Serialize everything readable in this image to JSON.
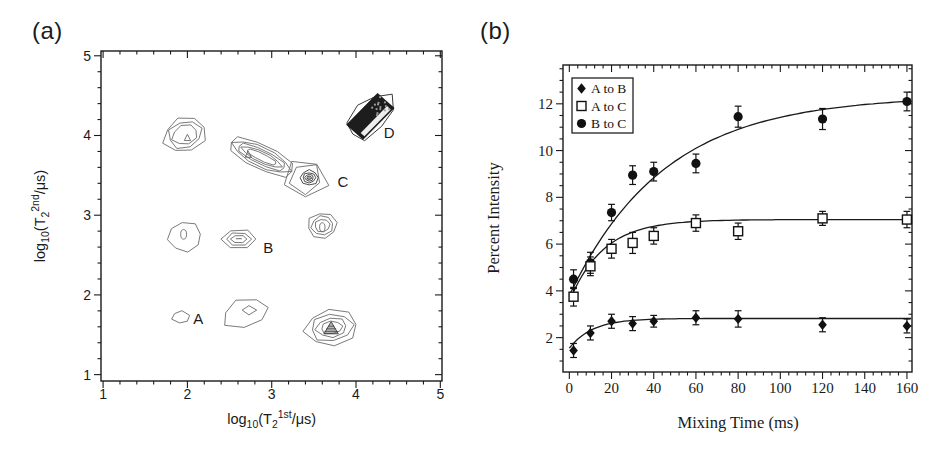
{
  "panels": {
    "a": {
      "tag": "(a)"
    },
    "b": {
      "tag": "(b)"
    }
  },
  "colors": {
    "axis": "#1a1a1a",
    "contour_line": "#6a6a6a",
    "contour_dark": "#3a3a3a",
    "marker_fill": "#111111",
    "curve": "#1a1a1a",
    "background": "#ffffff"
  },
  "chart_data": [
    {
      "type": "contour",
      "panel": "a",
      "xlabel_plain": "log10(T2 1st /us)",
      "ylabel_plain": "log10(T2 2nd /us)",
      "xlabel_parts": [
        {
          "t": "log",
          "k": "n"
        },
        {
          "t": "10",
          "k": "sub"
        },
        {
          "t": "(T",
          "k": "n"
        },
        {
          "t": "2",
          "k": "sub"
        },
        {
          "t": "1st",
          "k": "sup"
        },
        {
          "t": "/μs)",
          "k": "n"
        }
      ],
      "ylabel_parts": [
        {
          "t": "log",
          "k": "n"
        },
        {
          "t": "10",
          "k": "sub"
        },
        {
          "t": "(T",
          "k": "n"
        },
        {
          "t": "2",
          "k": "sub"
        },
        {
          "t": "2nd",
          "k": "sup"
        },
        {
          "t": "/μs)",
          "k": "n"
        }
      ],
      "box": {
        "left": 101,
        "top": 51,
        "right": 442,
        "bottom": 381
      },
      "x_range": [
        0.975,
        5.02
      ],
      "y_range": [
        0.92,
        5.06
      ],
      "x_ticks": [
        1,
        2,
        3,
        4,
        5
      ],
      "y_ticks": [
        1,
        2,
        3,
        4,
        5
      ],
      "x_minor_step": 0.2,
      "y_minor_step": 0.2,
      "peak_labels": [
        {
          "text": "A",
          "x": 2.07,
          "y": 1.7
        },
        {
          "text": "B",
          "x": 2.9,
          "y": 2.59
        },
        {
          "text": "C",
          "x": 3.78,
          "y": 3.42
        },
        {
          "text": "D",
          "x": 4.33,
          "y": 4.03
        }
      ],
      "peaks_summary": [
        {
          "label": "A",
          "x": 1.92,
          "y": 1.72
        },
        {
          "label": "B",
          "x": 2.61,
          "y": 2.7
        },
        {
          "label": "C",
          "x": 3.4,
          "y": 3.46
        },
        {
          "label": "D",
          "x": 4.17,
          "y": 4.24
        },
        {
          "label": "",
          "x": 1.97,
          "y": 4.01
        },
        {
          "label": "",
          "x": 1.97,
          "y": 2.73
        },
        {
          "label": "",
          "x": 2.69,
          "y": 1.77
        },
        {
          "label": "",
          "x": 2.88,
          "y": 3.73
        },
        {
          "label": "",
          "x": 3.6,
          "y": 2.87
        },
        {
          "label": "",
          "x": 3.71,
          "y": 1.59
        }
      ],
      "contours": [
        {
          "name": "peak-upper-left",
          "cx": 1.97,
          "cy": 4.01,
          "rot": 22,
          "sides": 8,
          "jit": 0.1,
          "seed": 1,
          "rings": [
            [
              0.26,
              0.21
            ],
            [
              0.205,
              0.165
            ],
            [
              0.155,
              0.12
            ]
          ],
          "inner": {
            "type": "ring",
            "cx": 2.0,
            "cy": 3.96,
            "rings": [
              [
                0.05,
                0.045
              ]
            ],
            "sides": 3,
            "rot": 90,
            "jit": 0.15,
            "seed": 2
          }
        },
        {
          "name": "peak-left-mid",
          "cx": 1.97,
          "cy": 2.73,
          "rot": 10,
          "sides": 8,
          "jit": 0.07,
          "seed": 3,
          "rings": [
            [
              0.2,
              0.185
            ]
          ],
          "inner": {
            "type": "ellipse",
            "cx": 1.955,
            "cy": 2.76,
            "rx": 0.035,
            "ry": 0.06
          }
        },
        {
          "name": "peak-A",
          "cx": 1.92,
          "cy": 1.72,
          "rot": 80,
          "sides": 6,
          "jit": 0.14,
          "seed": 4,
          "rings": [
            [
              0.075,
              0.105
            ]
          ]
        },
        {
          "name": "peak-B",
          "cx": 2.61,
          "cy": 2.7,
          "rot": 0,
          "sides": 6,
          "jit": 0.05,
          "seed": 5,
          "rings": [
            [
              0.205,
              0.125
            ],
            [
              0.15,
              0.085
            ],
            [
              0.095,
              0.05
            ]
          ],
          "inner": {
            "type": "dash",
            "x1": 2.575,
            "y1": 2.705,
            "x2": 2.645,
            "y2": 2.705
          }
        },
        {
          "name": "peak-below-B",
          "cx": 2.69,
          "cy": 1.77,
          "rot": 15,
          "sides": 7,
          "jit": 0.12,
          "seed": 6,
          "rings": [
            [
              0.285,
              0.175
            ]
          ],
          "inner": {
            "type": "ring",
            "cx": 2.73,
            "cy": 1.81,
            "rings": [
              [
                0.085,
                0.055
              ]
            ],
            "sides": 4,
            "rot": 0,
            "jit": 0.12,
            "seed": 7
          }
        },
        {
          "name": "peak-C-ridge",
          "cx": 2.88,
          "cy": 3.73,
          "rot": -27,
          "sides": 10,
          "jit": 0.07,
          "seed": 8,
          "rings": [
            [
              0.43,
              0.155
            ],
            [
              0.375,
              0.12
            ],
            [
              0.32,
              0.092
            ],
            [
              0.26,
              0.066
            ],
            [
              0.2,
              0.044
            ]
          ],
          "inner": {
            "type": "ring",
            "cx": 2.72,
            "cy": 3.75,
            "rings": [
              [
                0.05,
                0.045
              ]
            ],
            "sides": 3,
            "rot": 90,
            "jit": 0.12,
            "seed": 9
          }
        },
        {
          "name": "peak-C-core",
          "cx": 3.4,
          "cy": 3.46,
          "rot": -90,
          "sides": 5,
          "jit": 0.13,
          "seed": 10,
          "rings": [
            [
              0.25,
              0.26
            ],
            [
              0.19,
              0.2
            ]
          ],
          "inner": {
            "type": "rings-dark",
            "cx": 3.445,
            "cy": 3.47,
            "rings": [
              [
                0.105,
                0.095
              ],
              [
                0.075,
                0.065
              ],
              [
                0.05,
                0.042
              ],
              [
                0.028,
                0.022
              ]
            ],
            "sides": 8,
            "rot": 0,
            "jit": 0.08,
            "seed": 11
          }
        },
        {
          "name": "peak-right-mid",
          "cx": 3.6,
          "cy": 2.87,
          "rot": 12,
          "sides": 8,
          "jit": 0.08,
          "seed": 12,
          "rings": [
            [
              0.175,
              0.16
            ],
            [
              0.13,
              0.12
            ],
            [
              0.09,
              0.08
            ]
          ],
          "inner": {
            "type": "ellipse",
            "cx": 3.6,
            "cy": 2.85,
            "rx": 0.032,
            "ry": 0.055
          }
        },
        {
          "name": "peak-lower-right",
          "cx": 3.71,
          "cy": 1.59,
          "rot": 8,
          "sides": 8,
          "jit": 0.09,
          "seed": 13,
          "rings": [
            [
              0.315,
              0.225
            ],
            [
              0.25,
              0.17
            ],
            [
              0.185,
              0.12
            ],
            [
              0.125,
              0.08
            ]
          ],
          "inner": {
            "type": "hatch-tri",
            "cx": 3.705,
            "cy": 1.575,
            "r": 0.085
          }
        },
        {
          "name": "peak-D",
          "type": "dark-blob",
          "cx": 4.17,
          "cy": 4.24,
          "rot": 47,
          "len": 0.27,
          "wid": 0.135,
          "outline": [
            0.34,
            0.2
          ],
          "sides": 8,
          "jit": 0.12,
          "seed": 14
        }
      ]
    },
    {
      "type": "scatter",
      "panel": "b",
      "xlabel": "Mixing Time (ms)",
      "ylabel": "Percent Intensity",
      "box": {
        "left": 563,
        "top": 65,
        "right": 912,
        "bottom": 372
      },
      "x_range": [
        -3,
        162.4
      ],
      "y_range": [
        0.53,
        13.66
      ],
      "x_ticks": [
        0,
        20,
        40,
        60,
        80,
        100,
        120,
        140,
        160
      ],
      "y_ticks": [
        2,
        4,
        6,
        8,
        10,
        12
      ],
      "x_minor_step": 4,
      "y_minor_step": 0.5,
      "legend": {
        "x": 572,
        "y": 78,
        "w": 61,
        "h": 55,
        "items": [
          {
            "label": "A to B",
            "marker": "filled-diamond"
          },
          {
            "label": "A to C",
            "marker": "open-square"
          },
          {
            "label": "B to C",
            "marker": "filled-circle"
          }
        ]
      },
      "series": [
        {
          "name": "B to C",
          "marker": "filled-circle",
          "points": [
            [
              2,
              4.5
            ],
            [
              10,
              5.2
            ],
            [
              20,
              7.35
            ],
            [
              30,
              8.95
            ],
            [
              40,
              9.1
            ],
            [
              60,
              9.45
            ],
            [
              80,
              11.45
            ],
            [
              120,
              11.35
            ],
            [
              160,
              12.1
            ]
          ],
          "errors": [
            0.4,
            0.45,
            0.35,
            0.4,
            0.4,
            0.4,
            0.45,
            0.45,
            0.4
          ],
          "fit": {
            "y0": 3.8,
            "yinf": 12.35,
            "tau": 45
          }
        },
        {
          "name": "A to C",
          "marker": "open-square",
          "points": [
            [
              2,
              3.75
            ],
            [
              10,
              5.05
            ],
            [
              20,
              5.8
            ],
            [
              30,
              6.05
            ],
            [
              40,
              6.35
            ],
            [
              60,
              6.9
            ],
            [
              80,
              6.55
            ],
            [
              120,
              7.1
            ],
            [
              160,
              7.05
            ]
          ],
          "errors": [
            0.4,
            0.4,
            0.4,
            0.45,
            0.35,
            0.35,
            0.35,
            0.3,
            0.35
          ],
          "fit": {
            "y0": 3.55,
            "yinf": 7.05,
            "tau": 16
          }
        },
        {
          "name": "A to B",
          "marker": "filled-diamond",
          "points": [
            [
              2,
              1.45
            ],
            [
              10,
              2.2
            ],
            [
              20,
              2.7
            ],
            [
              30,
              2.6
            ],
            [
              40,
              2.7
            ],
            [
              60,
              2.85
            ],
            [
              80,
              2.8
            ],
            [
              120,
              2.55
            ],
            [
              160,
              2.5
            ]
          ],
          "errors": [
            0.3,
            0.3,
            0.3,
            0.3,
            0.25,
            0.3,
            0.35,
            0.3,
            0.3
          ],
          "fit": {
            "y0": 1.55,
            "yinf": 2.82,
            "tau": 11
          }
        }
      ]
    }
  ]
}
